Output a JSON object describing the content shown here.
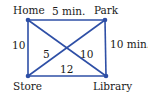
{
  "diagram": {
    "type": "weighted-graph",
    "edge_color": "#2e4fa6",
    "node_color": "#2e4fa6",
    "nodes": [
      {
        "id": "home",
        "label": "Home",
        "x": 28,
        "y": 20
      },
      {
        "id": "park",
        "label": "Park",
        "x": 105,
        "y": 20
      },
      {
        "id": "store",
        "label": "Store",
        "x": 28,
        "y": 76
      },
      {
        "id": "library",
        "label": "Library",
        "x": 106,
        "y": 76
      }
    ],
    "edges": [
      {
        "from": "home",
        "to": "park",
        "weight": "5 min."
      },
      {
        "from": "park",
        "to": "library",
        "weight": "10 min."
      },
      {
        "from": "home",
        "to": "store",
        "weight": "10"
      },
      {
        "from": "store",
        "to": "library",
        "weight": "12"
      },
      {
        "from": "store",
        "to": "park",
        "weight": "5"
      },
      {
        "from": "home",
        "to": "library",
        "weight": "10"
      }
    ]
  }
}
